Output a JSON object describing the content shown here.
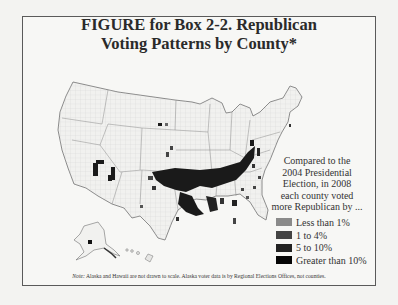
{
  "figure": {
    "title_line1": "FIGURE for Box 2-2. Republican",
    "title_line2": "Voting Patterns by County*"
  },
  "legend": {
    "caption": "Compared to the 2004 Presidential Election, in 2008 each county voted more Republican by ...",
    "caption_lines": [
      "Compared to the",
      "2004 Presidential",
      "Election, in 2008",
      "each county voted",
      "more Republican by ..."
    ],
    "items": [
      {
        "label": "Less than 1%",
        "color": "#8a8a8a"
      },
      {
        "label": "1 to 4%",
        "color": "#444444"
      },
      {
        "label": "5 to 10%",
        "color": "#222222"
      },
      {
        "label": "Greater than 10%",
        "color": "#050505"
      }
    ]
  },
  "note": {
    "prefix": "Note:",
    "text": "Alaska and Hawaii are not drawn to scale. Alaska voter data is by Regional Elections Offices, not counties."
  },
  "map": {
    "subject": "United States counties",
    "colors": {
      "outline": "#7a7a7a",
      "county_fill": "#f1f1ef",
      "county_grid": "#c9c9c9"
    }
  }
}
